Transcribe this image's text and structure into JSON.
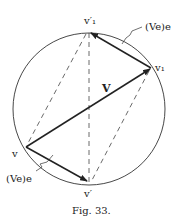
{
  "figure": {
    "caption": "Fig. 33.",
    "labels": {
      "v1_prime": "v′₁",
      "v1": "v₁",
      "V": "V",
      "v": "v",
      "v_prime": "v′",
      "ve_top": "(Ve)e",
      "ve_bottom": "(Ve)e"
    },
    "colors": {
      "stroke": "#222222",
      "background": "#ffffff"
    }
  }
}
